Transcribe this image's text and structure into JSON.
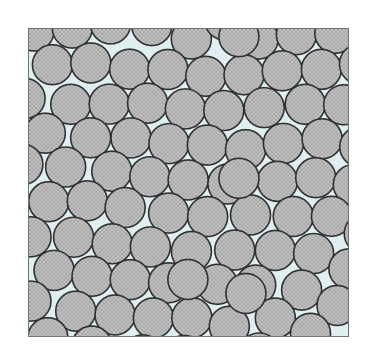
{
  "figure": {
    "kind": "scientific-illustration",
    "caption_text": "",
    "title_text": "",
    "outer_background_color": "#ffffff",
    "canvas_width": 376,
    "canvas_height": 359
  },
  "frame": {
    "name": "square-domain-border",
    "x": 28,
    "y": 28,
    "width": 321,
    "height": 309,
    "border_color": "#6f7478",
    "border_width": 1,
    "fill_color": "#e6f2f4",
    "texture_color": "#d8eaee"
  },
  "particles": {
    "count": 103,
    "shape": "circle",
    "diameter": 40,
    "radius": 20,
    "fill_color": "#b9b9b9",
    "fill_highlight_color": "#cfcfcf",
    "stipple_color": "#9a9a9a",
    "outline_color": "#2f3133",
    "outline_width": 1.6,
    "clipped_at_frame": true,
    "positions": [
      [
        34,
        33
      ],
      [
        72,
        36
      ],
      [
        110,
        31
      ],
      [
        148,
        30
      ],
      [
        186,
        34
      ],
      [
        221,
        29
      ],
      [
        259,
        33
      ],
      [
        297,
        30
      ],
      [
        334,
        34
      ],
      [
        52,
        63
      ],
      [
        90,
        68
      ],
      [
        128,
        62
      ],
      [
        166,
        64
      ],
      [
        204,
        60
      ],
      [
        241,
        66
      ],
      [
        279,
        61
      ],
      [
        316,
        64
      ],
      [
        347,
        58
      ],
      [
        33,
        95
      ],
      [
        70,
        100
      ],
      [
        108,
        96
      ],
      [
        147,
        99
      ],
      [
        185,
        93
      ],
      [
        223,
        97
      ],
      [
        261,
        101
      ],
      [
        299,
        95
      ],
      [
        337,
        98
      ],
      [
        48,
        130
      ],
      [
        86,
        127
      ],
      [
        123,
        133
      ],
      [
        161,
        129
      ],
      [
        199,
        131
      ],
      [
        237,
        127
      ],
      [
        275,
        134
      ],
      [
        313,
        129
      ],
      [
        349,
        131
      ],
      [
        31,
        163
      ],
      [
        69,
        165
      ],
      [
        107,
        160
      ],
      [
        145,
        166
      ],
      [
        183,
        162
      ],
      [
        221,
        167
      ],
      [
        259,
        161
      ],
      [
        297,
        166
      ],
      [
        334,
        163
      ],
      [
        50,
        196
      ],
      [
        88,
        199
      ],
      [
        126,
        194
      ],
      [
        164,
        198
      ],
      [
        202,
        193
      ],
      [
        240,
        199
      ],
      [
        278,
        195
      ],
      [
        316,
        198
      ],
      [
        348,
        192
      ],
      [
        33,
        229
      ],
      [
        71,
        232
      ],
      [
        109,
        227
      ],
      [
        147,
        231
      ],
      [
        185,
        228
      ],
      [
        223,
        233
      ],
      [
        261,
        229
      ],
      [
        299,
        232
      ],
      [
        336,
        228
      ],
      [
        49,
        262
      ],
      [
        87,
        265
      ],
      [
        125,
        260
      ],
      [
        163,
        264
      ],
      [
        201,
        261
      ],
      [
        239,
        266
      ],
      [
        277,
        260
      ],
      [
        315,
        264
      ],
      [
        347,
        261
      ],
      [
        32,
        295
      ],
      [
        70,
        298
      ],
      [
        108,
        293
      ],
      [
        146,
        297
      ],
      [
        184,
        294
      ],
      [
        222,
        299
      ],
      [
        260,
        294
      ],
      [
        298,
        297
      ],
      [
        335,
        293
      ],
      [
        51,
        328
      ],
      [
        89,
        331
      ],
      [
        127,
        326
      ],
      [
        165,
        330
      ],
      [
        203,
        327
      ],
      [
        241,
        332
      ],
      [
        279,
        327
      ],
      [
        317,
        330
      ],
      [
        348,
        326
      ],
      [
        59,
        47
      ],
      [
        138,
        47
      ],
      [
        217,
        48
      ],
      [
        295,
        47
      ],
      [
        40,
        113
      ],
      [
        200,
        113
      ],
      [
        320,
        113
      ],
      [
        58,
        246
      ],
      [
        178,
        246
      ],
      [
        298,
        246
      ],
      [
        95,
        312
      ],
      [
        255,
        312
      ],
      [
        340,
        80
      ]
    ]
  },
  "accessibility": {
    "alt_text": "A square frame with a pale blue background densely filled with many equal-sized gray stippled circles arranged in a random close-packed pattern, with circles clipped at the frame edges."
  }
}
